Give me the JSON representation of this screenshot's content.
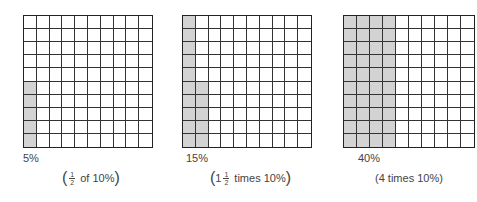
{
  "chart_data": {
    "type": "grid-diagram",
    "grid_size": [
      10,
      10
    ],
    "shade_color": "#d3d3d3",
    "panels": [
      {
        "label": "5%",
        "caption": {
          "prefix": "",
          "whole": "",
          "fraction": {
            "num": "1",
            "den": "2"
          },
          "suffix": "of 10%"
        },
        "caption_text": "(1/2 of 10%)",
        "value_percent": 5,
        "shaded_cells": "column 1, bottom 5 rows"
      },
      {
        "label": "15%",
        "caption": {
          "prefix": "",
          "whole": "1",
          "fraction": {
            "num": "1",
            "den": "2"
          },
          "suffix": "times 10%"
        },
        "caption_text": "(1 1/2 times 10%)",
        "value_percent": 15,
        "shaded_cells": "column 1 full, column 2 bottom 5 rows"
      },
      {
        "label": "40%",
        "caption": {
          "prefix": "",
          "whole": "",
          "fraction": null,
          "suffix": "4 times 10%"
        },
        "caption_text": "(4 times 10%)",
        "value_percent": 40,
        "shaded_cells": "columns 1-4 full"
      }
    ]
  },
  "panels": [
    {
      "label": "5%",
      "caption_whole": "",
      "frac_num": "1",
      "frac_den": "2",
      "caption_suffix": "of 10%"
    },
    {
      "label": "15%",
      "caption_whole": "1",
      "frac_num": "1",
      "frac_den": "2",
      "caption_suffix": "times 10%"
    },
    {
      "label": "40%",
      "caption_text": "4 times 10%"
    }
  ]
}
